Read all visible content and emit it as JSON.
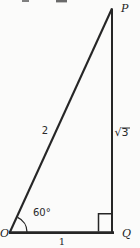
{
  "figure": {
    "labels": {
      "vertex_p": "P",
      "vertex_o": "O",
      "vertex_q": "Q",
      "hypotenuse_length": "2",
      "vertical_side_length": "√3",
      "base_length": "1",
      "angle_at_o": "60°"
    },
    "colors": {
      "ink": "#262626",
      "paper": "#fbfbfa"
    }
  }
}
